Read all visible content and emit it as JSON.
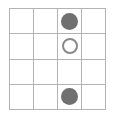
{
  "diagram": {
    "type": "marker-grid",
    "title": "",
    "background_color": "#ffffff",
    "grid": {
      "columns": 4,
      "rows": 4,
      "line_color": "#b3b3b3",
      "line_width_px": 1,
      "cell_width_px": 24,
      "cell_height_px": 26,
      "origin_x_px": 9,
      "origin_y_px": 8
    },
    "markers": {
      "filled_color": "#707070",
      "open_fill_color": "#ffffff",
      "open_stroke_color": "#8a8a8a",
      "filled_diameter_px": 17,
      "open_diameter_px": 16
    },
    "cells": [
      {
        "row": 1,
        "col": 1,
        "marker": "empty",
        "label": ""
      },
      {
        "row": 1,
        "col": 2,
        "marker": "empty",
        "label": ""
      },
      {
        "row": 1,
        "col": 3,
        "marker": "filled",
        "label": ""
      },
      {
        "row": 1,
        "col": 4,
        "marker": "empty",
        "label": ""
      },
      {
        "row": 2,
        "col": 1,
        "marker": "empty",
        "label": ""
      },
      {
        "row": 2,
        "col": 2,
        "marker": "empty",
        "label": ""
      },
      {
        "row": 2,
        "col": 3,
        "marker": "open",
        "label": ""
      },
      {
        "row": 2,
        "col": 4,
        "marker": "empty",
        "label": ""
      },
      {
        "row": 3,
        "col": 1,
        "marker": "empty",
        "label": ""
      },
      {
        "row": 3,
        "col": 2,
        "marker": "empty",
        "label": ""
      },
      {
        "row": 3,
        "col": 3,
        "marker": "empty",
        "label": ""
      },
      {
        "row": 3,
        "col": 4,
        "marker": "empty",
        "label": ""
      },
      {
        "row": 4,
        "col": 1,
        "marker": "empty",
        "label": ""
      },
      {
        "row": 4,
        "col": 2,
        "marker": "empty",
        "label": ""
      },
      {
        "row": 4,
        "col": 3,
        "marker": "filled",
        "label": ""
      },
      {
        "row": 4,
        "col": 4,
        "marker": "empty",
        "label": ""
      }
    ]
  }
}
